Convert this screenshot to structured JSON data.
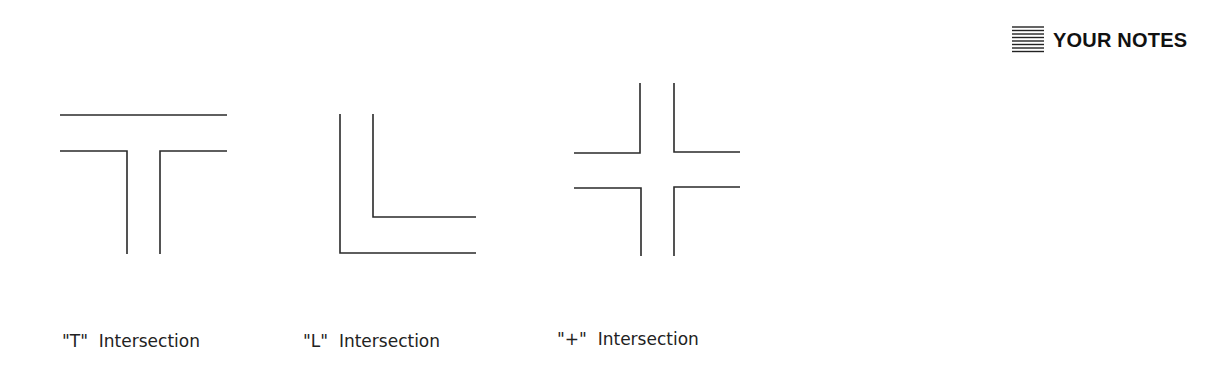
{
  "header": {
    "notes_icon": "lined-notepad-icon",
    "notes_title": "YOUR NOTES"
  },
  "diagrams": [
    {
      "id": "t",
      "label": "\"T\"  Intersection"
    },
    {
      "id": "l",
      "label": "\"L\"  Intersection"
    },
    {
      "id": "plus",
      "label": "\"+\"  Intersection"
    }
  ],
  "colors": {
    "line": "#2a2a2a",
    "background": "#ffffff"
  }
}
